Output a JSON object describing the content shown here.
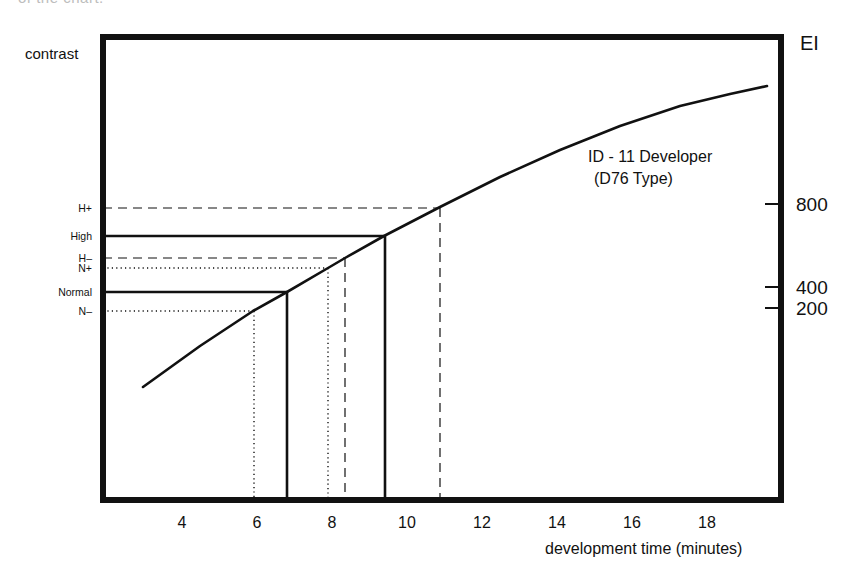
{
  "page": {
    "clipped_caption": "of the chart."
  },
  "chart_data": {
    "type": "line",
    "title": "",
    "xlabel": "development time (minutes)",
    "ylabel_left": "contrast",
    "ylabel_right": "EI",
    "xlim": [
      0,
      20
    ],
    "x_ticks": [
      4,
      6,
      8,
      10,
      12,
      14,
      16,
      18
    ],
    "grid": false,
    "series": [
      {
        "name": "ID-11 Developer (D76 Type)",
        "annotation_line1": "ID - 11 Developer",
        "annotation_line2": "(D76 Type)",
        "points_px": [
          [
            143,
            387
          ],
          [
            200,
            346
          ],
          [
            253,
            311
          ],
          [
            287,
            292
          ],
          [
            328,
            268
          ],
          [
            345,
            258
          ],
          [
            384,
            236
          ],
          [
            440,
            207
          ],
          [
            500,
            177
          ],
          [
            560,
            150
          ],
          [
            620,
            126
          ],
          [
            680,
            106
          ],
          [
            730,
            94
          ],
          [
            767,
            86
          ]
        ],
        "x": [
          3.0,
          4.5,
          5.9,
          6.8,
          7.9,
          8.35,
          9.4,
          10.9,
          12.5,
          14.1,
          15.7,
          17.3,
          18.6,
          19.6
        ]
      }
    ],
    "contrast_levels": [
      {
        "label": "H+",
        "time": 10.9,
        "style": "dashed",
        "y_px": 208,
        "x_px": 440
      },
      {
        "label": "High",
        "time": 9.4,
        "style": "solid",
        "y_px": 236,
        "x_px": 385
      },
      {
        "label": "H-",
        "time": 8.35,
        "style": "dashed",
        "y_px": 258,
        "x_px": 345
      },
      {
        "label": "N+",
        "time": 7.9,
        "style": "dotted",
        "y_px": 268,
        "x_px": 328
      },
      {
        "label": "Normal",
        "time": 6.8,
        "style": "solid",
        "y_px": 292,
        "x_px": 287
      },
      {
        "label": "N-",
        "time": 5.9,
        "style": "dotted",
        "y_px": 311,
        "x_px": 254
      }
    ],
    "ei_ticks": [
      {
        "label": "800",
        "y_px": 204
      },
      {
        "label": "400",
        "y_px": 287
      },
      {
        "label": "200",
        "y_px": 308
      }
    ],
    "layout": {
      "frame": {
        "left": 103,
        "top": 37,
        "right": 781,
        "bottom": 500,
        "stroke": 6
      },
      "x_px_per_unit": 37.5,
      "x_px_origin": 32,
      "tick_label_y": 528,
      "line_color": "#111111"
    }
  }
}
